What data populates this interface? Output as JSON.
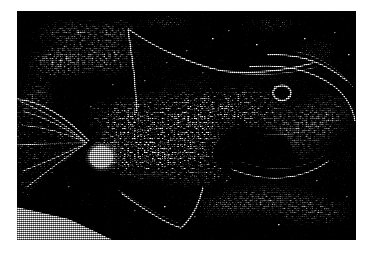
{
  "image": {
    "kind": "photograph",
    "subject": "fish",
    "description": "High-contrast black-and-white halftone photograph of a fish in lateral view, head toward the right, tail toward the left",
    "medium": "halftone / dithered print",
    "orientation": "landscape",
    "border": {
      "color": "#ffffff",
      "left_px": 17,
      "top_px": 11,
      "right_px": 13,
      "bottom_px": 14
    },
    "plate": {
      "x": 17,
      "y": 11,
      "width": 339,
      "height": 229,
      "background_color": "#000000",
      "highlight_color": "#ffffff"
    },
    "palette": {
      "black": "#000000",
      "white": "#ffffff",
      "page": "#ffffff",
      "mid_gray": "#8a8a8a"
    },
    "features": [
      {
        "name": "dorsal-fin",
        "note": "long bright leading edge sweeping up-left from the back, apex near upper-left of the body"
      },
      {
        "name": "eye",
        "note": "small bright ring on the head, right of centre"
      },
      {
        "name": "head-profile",
        "note": "bright curved line running from the nape down and to the right around the snout"
      },
      {
        "name": "body-scales",
        "note": "dense speckled highlight texture across the mid-body flank"
      },
      {
        "name": "caudal-peduncle-highlight",
        "note": "bright blob where the body narrows into the tail, left of centre"
      },
      {
        "name": "caudal-fin",
        "note": "fan of radiating bright streaks at the far left"
      },
      {
        "name": "anal-fin",
        "note": "V-shaped bright outline beneath the belly, lower-centre"
      },
      {
        "name": "pelvic-fin-edge",
        "note": "curved bright arc in the lower-right of the plate"
      },
      {
        "name": "background-speckle",
        "note": "bright dithered clouds in the upper-left and lower-right of the plate"
      },
      {
        "name": "bright-wedge",
        "note": "pale triangular wedge in the bottom-left corner of the plate"
      }
    ]
  }
}
